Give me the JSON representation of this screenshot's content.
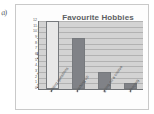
{
  "annotation": {
    "margin_mark": "a)"
  },
  "chart_data": {
    "type": "bar",
    "title": "Favourite Hobbies",
    "xlabel": "",
    "ylabel": "Number of Examiners",
    "categories": [
      "writing questions",
      "marking up",
      "going on a course",
      "sleeping"
    ],
    "values": [
      12,
      9,
      3,
      1
    ],
    "ylim": [
      0,
      12
    ],
    "ytick_labels": [
      "0",
      "1",
      "2",
      "3",
      "4",
      "5",
      "6",
      "7",
      "8",
      "9",
      "10",
      "11",
      "12"
    ],
    "ytick_values": [
      0,
      1,
      2,
      3,
      4,
      5,
      6,
      7,
      8,
      9,
      10,
      11,
      12
    ],
    "grid": true,
    "legend": "none",
    "bar_colors": [
      "#e8e8e8",
      "#808287",
      "#808287",
      "#808287"
    ],
    "plot_background": "#d3d3d3"
  }
}
